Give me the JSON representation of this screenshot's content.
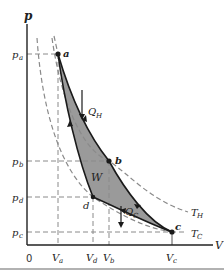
{
  "diagram": {
    "type": "pV diagram (Carnot cycle)",
    "axes": {
      "y_label": "p",
      "x_label": "V",
      "origin_label": "0",
      "y_ticks": [
        "p_a",
        "p_b",
        "p_d",
        "p_c"
      ],
      "x_ticks": [
        "V_a",
        "V_d",
        "V_b",
        "V_c"
      ]
    },
    "points": [
      {
        "id": "a",
        "label": "a"
      },
      {
        "id": "b",
        "label": "b"
      },
      {
        "id": "c",
        "label": "c"
      },
      {
        "id": "d",
        "label": "d"
      }
    ],
    "isotherms": [
      {
        "id": "hot",
        "label": "T",
        "sub": "H"
      },
      {
        "id": "cold",
        "label": "T",
        "sub": "C"
      }
    ],
    "annotations": {
      "heat_in": {
        "label": "Q",
        "sub": "H"
      },
      "heat_out": {
        "label": "Q",
        "sub": "C"
      },
      "work": "W"
    },
    "labels": {
      "pa_main": "p",
      "pa_sub": "a",
      "pb_main": "p",
      "pb_sub": "b",
      "pd_main": "p",
      "pd_sub": "d",
      "pc_main": "p",
      "pc_sub": "c",
      "va_main": "V",
      "va_sub": "a",
      "vd_main": "V",
      "vd_sub": "d",
      "vb_main": "V",
      "vb_sub": "b",
      "vc_main": "V",
      "vc_sub": "c"
    },
    "colors": {
      "fill": "#9a9a9a",
      "stroke": "#1a1a1a",
      "dashed": "#8a8a8a",
      "bottom_rule": "#999999"
    }
  }
}
